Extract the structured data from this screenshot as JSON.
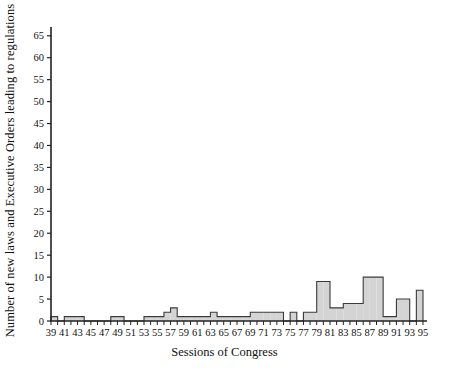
{
  "chart_data": {
    "type": "bar",
    "title": "",
    "subtitle": "",
    "xlabel": "Sessions of Congress",
    "ylabel": "Number of new laws and Executive Orders leading to regulations",
    "xlim": [
      39,
      95
    ],
    "ylim": [
      0,
      67
    ],
    "grid": false,
    "legend": null,
    "annotations": [],
    "x_tick_labels": [
      "39",
      "41",
      "43",
      "45",
      "47",
      "49",
      "51",
      "53",
      "55",
      "57",
      "59",
      "61",
      "63",
      "65",
      "67",
      "69",
      "71",
      "73",
      "75",
      "77",
      "79",
      "81",
      "83",
      "85",
      "87",
      "89",
      "91",
      "93",
      "95"
    ],
    "y_tick_labels": [
      "0",
      "5",
      "10",
      "15",
      "20",
      "25",
      "30",
      "35",
      "40",
      "45",
      "50",
      "55",
      "60",
      "65"
    ],
    "y_tick_values": [
      0,
      5,
      10,
      15,
      20,
      25,
      30,
      35,
      40,
      45,
      50,
      55,
      60,
      65
    ],
    "x_minor_tick_step": 1,
    "bar_fill_color": "#d4d4d4",
    "bar_edge_color": "#3a3a3a",
    "axis_color": "#222222",
    "categories": [
      39,
      40,
      41,
      42,
      43,
      44,
      45,
      46,
      47,
      48,
      49,
      50,
      51,
      52,
      53,
      54,
      55,
      56,
      57,
      58,
      59,
      60,
      61,
      62,
      63,
      64,
      65,
      66,
      67,
      68,
      69,
      70,
      71,
      72,
      73,
      74,
      75,
      76,
      77,
      78,
      79,
      80,
      81,
      82,
      83,
      84,
      85,
      86,
      87,
      88,
      89,
      90,
      91,
      92,
      93,
      94
    ],
    "values": [
      1,
      0,
      1,
      1,
      1,
      0,
      0,
      0,
      0,
      1,
      1,
      0,
      0,
      0,
      1,
      1,
      1,
      2,
      3,
      1,
      1,
      1,
      1,
      1,
      2,
      1,
      1,
      1,
      1,
      1,
      2,
      2,
      2,
      2,
      2,
      0,
      2,
      0,
      2,
      2,
      9,
      9,
      3,
      3,
      4,
      4,
      4,
      10,
      10,
      10,
      1,
      1,
      5,
      5,
      0,
      7
    ]
  }
}
